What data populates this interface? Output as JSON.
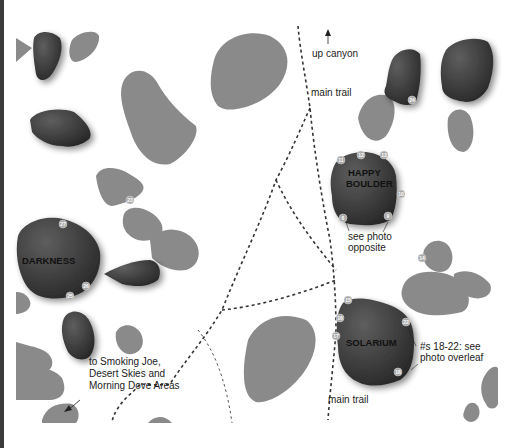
{
  "map": {
    "labels": {
      "up_canyon": "up canyon",
      "main_trail_top": "main trail",
      "main_trail_bottom": "main trail",
      "happy_boulder_line1": "HAPPY",
      "happy_boulder_line2": "BOULDER",
      "solarium": "SOLARIUM",
      "darkness": "DARKNESS",
      "see_photo_line1": "see photo",
      "see_photo_line2": "opposite",
      "overleaf_line1": "#s 18-22: see",
      "overleaf_line2": "photo overleaf",
      "directions_line1": "to Smoking Joe,",
      "directions_line2": "Desert Skies and",
      "directions_line3": "Morning Dove Areas"
    },
    "problem_numbers": {
      "happy_boulder": [
        "11",
        "12",
        "13",
        "10",
        "9",
        "8"
      ],
      "solarium": [
        "15",
        "16",
        "17",
        "22",
        "18"
      ],
      "darkness": [
        "27",
        "26",
        "25"
      ],
      "other": [
        "24",
        "23",
        "14"
      ]
    },
    "colors": {
      "rock_light": "#8a8a8a",
      "rock_dark": "#3c3c3c",
      "trail": "#333333",
      "marker": "#a8a8a8"
    }
  }
}
